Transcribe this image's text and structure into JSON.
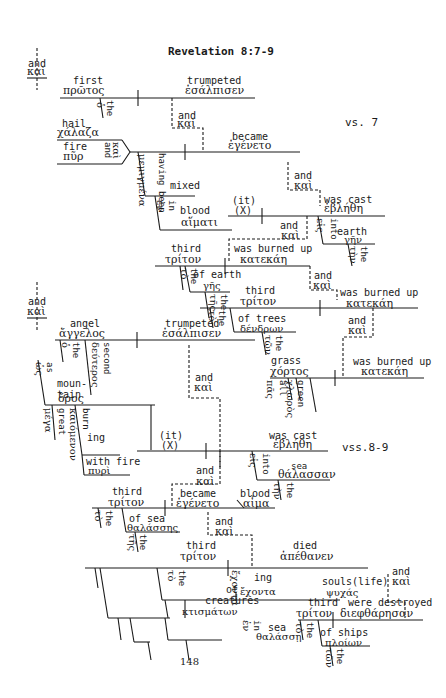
{
  "title": "Revelation 8:7-9",
  "verse_labels": {
    "vs7": "vs. 7",
    "vs89": "vss.8-9"
  },
  "page_number": "148",
  "words": {
    "and1_en": "and",
    "and1_gr": "καὶ",
    "first_en": "first",
    "first_gr": "πρῶτος",
    "the1": "the",
    "o1": "ὁ",
    "trumpeted_en": "trumpeted",
    "trumpeted_gr": "ἐσάλπισεν",
    "and2_en": "and",
    "and2_gr": "καὶ",
    "became_en": "became",
    "became_gr": "ἐγένετο",
    "hail_en": "hail",
    "hail_gr": "χάλαζα",
    "fire_en": "fire",
    "fire_gr": "πῦρ",
    "and_v_en": "and",
    "and_v_gr": "καὶ",
    "having_been": "having been",
    "mixed_en": "mixed",
    "mixed_gr": "μεμιγμένα",
    "in1_en": "in",
    "in1_gr": "ἐν",
    "blood_en": "blood",
    "blood_gr": "αἵματι",
    "and3_en": "and",
    "and3_gr": "καὶ",
    "it_en": "(it)",
    "x_en": "(X)",
    "was_cast1_en": "was cast",
    "was_cast1_gr": "ἐβλήθη",
    "and4_en": "and",
    "and4_gr": "καὶ",
    "into1_en": "into",
    "into1_gr": "εἰς",
    "earth_en": "earth",
    "earth_gr": "γῆν",
    "the_earth": "the",
    "ten_earth": "τὴν",
    "third1_en": "third",
    "third1_gr": "τρίτον",
    "the_third1": "the",
    "to_third1": "τὸ",
    "of_earth_en": "of earth",
    "of_earth_gr": "γῆς",
    "the_of_earth": "the",
    "tes_of_earth": "τῆς",
    "burned1_en": "was burned up",
    "burned1_gr": "κατεκάη",
    "and5_en": "and",
    "and5_gr": "καὶ",
    "third2_en": "third",
    "third2_gr": "τρίτον",
    "of_trees_en": "of trees",
    "of_trees_gr": "δένδρων",
    "the_trees": "the",
    "ton_trees": "τῶν",
    "burned2_en": "was burned up",
    "burned2_gr": "κατεκάη",
    "and6_en": "and",
    "and6_gr": "καὶ",
    "grass_en": "grass",
    "grass_gr": "χόρτος",
    "all_en": "all",
    "all_gr": "πᾶς",
    "green_en": "green",
    "green_gr": "χλωρὸς",
    "burned3_en": "was burned up",
    "burned3_gr": "κατεκάη",
    "and7_en": "and",
    "and7_gr": "καὶ",
    "angel_en": "angel",
    "angel_gr": "ἄγγελος",
    "the_angel": "the",
    "o_angel": "ὁ",
    "second_en": "second",
    "second_gr": "δεύτερος",
    "trumpeted2_en": "trumpeted",
    "trumpeted2_gr": "ἐσάλπισεν",
    "and8_en": "and",
    "and8_gr": "καὶ",
    "as_en": "as",
    "as_gr": "ὡς",
    "mountain_en": "moun-\ntain",
    "mountain_gr": "ὄρος",
    "great_en": "great",
    "great_gr": "μέγα",
    "burning_en": "burn",
    "burning_ing": "ing",
    "burning_gr": "καιόμενον",
    "with_fire_en": "with fire",
    "with_fire_gr": "πυρὶ",
    "it2_en": "(it)",
    "x2_en": "(X)",
    "was_cast2_en": "was cast",
    "was_cast2_gr": "ἐβλήθη",
    "into2_en": "into",
    "into2_gr": "εἰς",
    "sea1_en": "sea",
    "sea1_gr": "θάλασσαν",
    "the_sea1": "the",
    "ten_sea1": "τὴν",
    "and9_en": "and",
    "and9_gr": "καὶ",
    "third3_en": "third",
    "third3_gr": "τρίτον",
    "became2_en": "became",
    "became2_gr": "ἐγένετο",
    "blood2_en": "blood",
    "blood2_gr": "αἷμα",
    "of_sea_en": "of sea",
    "of_sea_gr": "θαλάσσης",
    "and10_en": "and",
    "and10_gr": "καὶ",
    "third4_en": "third",
    "third4_gr": "τρίτον",
    "died_en": "died",
    "died_gr": "ἀπέθανεν",
    "of_creatures_en": "of\ncreatures",
    "of_creatures_gr": "κτισμάτων",
    "having_en": "hav",
    "having_ing": "ing",
    "having_gr": "ἔχοντα",
    "souls_en": "souls(life)",
    "souls_gr": "ψυχάς",
    "and11_en": "and",
    "and11_gr": "καὶ",
    "in2_en": "in",
    "in2_gr": "ἐν",
    "sea2_en": "sea",
    "sea2_gr": "θαλάσσῃ",
    "third5_en": "third",
    "third5_gr": "τρίτον",
    "destroyed_en": "were destroyed",
    "destroyed_gr": "διεφθάρησαν",
    "of_ships_en": "of ships",
    "of_ships_gr": "πλοίων",
    "the_gen": "the",
    "ton_gen": "τῶν",
    "to_gen": "τὸ",
    "tes_gen": "τῆς",
    "ta_gen": "τὰ",
    "te_gen": "τῇ"
  }
}
